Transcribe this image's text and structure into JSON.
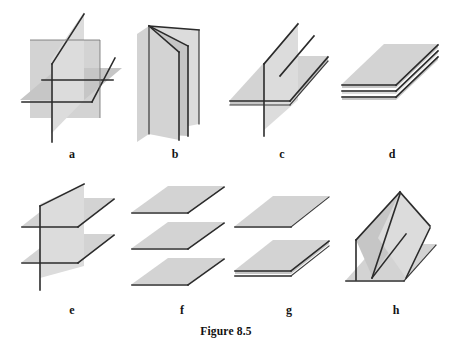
{
  "figure": {
    "caption": "Figure 8.5",
    "background_color": "#ffffff",
    "plane_fill_color": "#d3d3d3",
    "edge_color": "#2b2b2b"
  },
  "panels": [
    {
      "id": "a",
      "label": "a",
      "description": "Three planes intersecting pairwise in three distinct parallel-free lines meeting at a single point"
    },
    {
      "id": "b",
      "label": "b",
      "description": "Three planes sharing one common line of intersection, like pages of an open book"
    },
    {
      "id": "c",
      "label": "c",
      "description": "Two parallel planes both cut by a third transverse plane in two parallel lines"
    },
    {
      "id": "d",
      "label": "d",
      "description": "Three coincident planes stacked on one another"
    },
    {
      "id": "e",
      "label": "e",
      "description": "Two parallel planes intersected by a vertical plane"
    },
    {
      "id": "f",
      "label": "f",
      "description": "Three distinct parallel planes with no intersection"
    },
    {
      "id": "g",
      "label": "g",
      "description": "One plane parallel to two coincident planes"
    },
    {
      "id": "h",
      "label": "h",
      "description": "Two tilted planes forming a V meeting a horizontal plane in two lines"
    }
  ]
}
